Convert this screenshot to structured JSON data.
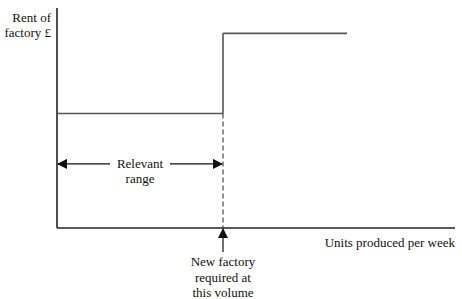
{
  "chart_data": {
    "type": "line",
    "title": "",
    "xlabel": "Units produced per week",
    "ylabel_lines": [
      "Rent of",
      "factory £"
    ],
    "xlim": [
      0,
      10
    ],
    "ylim": [
      0,
      10
    ],
    "grid": false,
    "series": [
      {
        "name": "Rent of factory (stepped fixed cost)",
        "x": [
          0,
          4.15,
          4.15,
          7.25
        ],
        "y": [
          5,
          5,
          8.5,
          8.5
        ]
      }
    ],
    "step_at_x": 4.15,
    "annotations": [
      {
        "id": "relevant-range",
        "lines": [
          "Relevant",
          "range"
        ],
        "from_x": 0,
        "to_x": 4.15,
        "at_y": 2.8
      },
      {
        "id": "new-factory",
        "lines": [
          "New factory",
          "required at",
          "this volume"
        ],
        "at_x": 4.15
      }
    ],
    "colors": {
      "axis": "#222222",
      "line": "#555555",
      "text": "#111111"
    }
  }
}
